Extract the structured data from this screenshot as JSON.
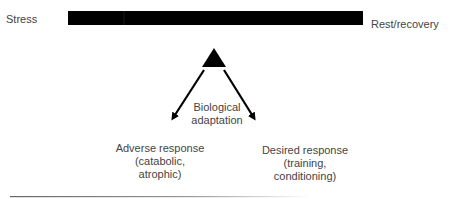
{
  "labels": {
    "stress": "Stress",
    "rest": "Rest/recovery",
    "bio_line1": "Biological",
    "bio_line2": "adaptation",
    "adverse_line1": "Adverse response",
    "adverse_line2": "(catabolic,",
    "adverse_line3": "atrophic)",
    "desired_line1": "Desired response",
    "desired_line2": "(training,",
    "desired_line3": "conditioning)"
  },
  "colors": {
    "bar": "#000000",
    "text": "#444444",
    "rule": "#777777"
  }
}
